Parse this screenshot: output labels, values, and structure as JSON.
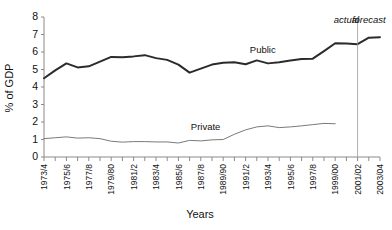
{
  "chart_data": {
    "type": "line",
    "title": "",
    "xlabel": "Years",
    "ylabel": "% of GDP",
    "ylim": [
      0,
      8
    ],
    "ytick_values": [
      0,
      1,
      2,
      3,
      4,
      5,
      6,
      7,
      8
    ],
    "grid": false,
    "legend_position": "inline-annotations",
    "x": [
      "1973/4",
      "1974/5",
      "1975/6",
      "1976/7",
      "1977/8",
      "1978/9",
      "1979/80",
      "1980/1",
      "1981/2",
      "1982/3",
      "1983/4",
      "1984/5",
      "1985/6",
      "1986/7",
      "1987/8",
      "1988/9",
      "1989/90",
      "1990/1",
      "1991/2",
      "1992/3",
      "1993/4",
      "1994/5",
      "1995/6",
      "1996/7",
      "1997/8",
      "1998/9",
      "1999/00",
      "2000/01",
      "2001/02",
      "2002/03",
      "2003/04"
    ],
    "xtick_labels": [
      "1973/4",
      "1975/6",
      "1977/8",
      "1979/80",
      "1981/2",
      "1983/4",
      "1985/6",
      "1987/8",
      "1989/90",
      "1991/2",
      "1993/4",
      "1995/6",
      "1997/8",
      "1999/00",
      "2001/02",
      "2003/04"
    ],
    "series": [
      {
        "name": "Public",
        "color": "#2b2b2b",
        "width": 2.0,
        "values": [
          4.5,
          4.95,
          5.35,
          5.12,
          5.18,
          5.45,
          5.72,
          5.7,
          5.75,
          5.82,
          5.65,
          5.55,
          5.28,
          4.82,
          5.05,
          5.28,
          5.38,
          5.42,
          5.3,
          5.52,
          5.35,
          5.42,
          5.52,
          5.6,
          5.62,
          6.05,
          6.5,
          6.48,
          6.45,
          6.82,
          6.85
        ]
      },
      {
        "name": "Private",
        "color": "#7a7a7a",
        "width": 1.0,
        "values": [
          1.05,
          1.1,
          1.15,
          1.08,
          1.1,
          1.05,
          0.9,
          0.85,
          0.88,
          0.88,
          0.86,
          0.86,
          0.8,
          0.95,
          0.92,
          0.98,
          1.0,
          1.3,
          1.55,
          1.72,
          1.78,
          1.68,
          1.72,
          1.78,
          1.85,
          1.92,
          1.9,
          null,
          null,
          null,
          null
        ]
      }
    ],
    "annotations": [
      {
        "name": "actual",
        "text": "actual",
        "x_index": 27,
        "style": "italic"
      },
      {
        "name": "forecast",
        "text": "forecast",
        "x_index": 29,
        "style": "italic"
      }
    ],
    "divider": {
      "name": "actual-forecast-divider",
      "x_index": 28,
      "label": "2001/02"
    }
  },
  "labels": {
    "ylabel": "% of GDP",
    "xlabel": "Years",
    "public": "Public",
    "private": "Private",
    "actual": "actual",
    "forecast": "forecast"
  }
}
